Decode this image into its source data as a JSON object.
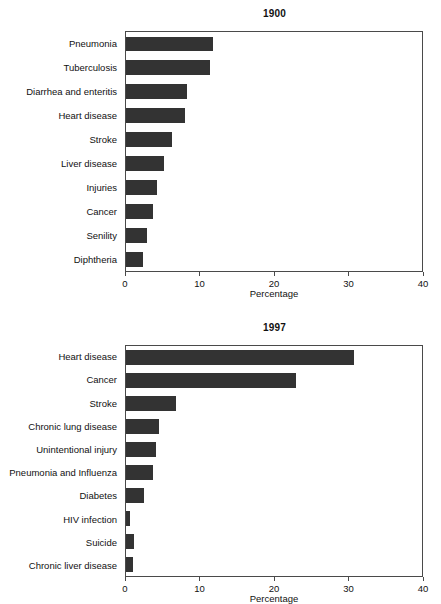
{
  "chart_data": [
    {
      "type": "bar",
      "orientation": "horizontal",
      "title": "1900",
      "xlabel": "Percentage",
      "ylabel": "",
      "xlim": [
        0,
        40
      ],
      "xticks": [
        0,
        10,
        20,
        30,
        40
      ],
      "xticklabels": [
        "0",
        "10",
        "20",
        "30",
        "40"
      ],
      "grid": false,
      "legend": false,
      "bar_color": "#333333",
      "frame_color": "#4a4a4a",
      "categories": [
        "Pneumonia",
        "Tuberculosis",
        "Diarrhea and enteritis",
        "Heart disease",
        "Stroke",
        "Liver disease",
        "Injuries",
        "Cancer",
        "Senility",
        "Diphtheria"
      ],
      "values": [
        11.8,
        11.3,
        8.3,
        8.0,
        6.2,
        5.2,
        4.2,
        3.7,
        2.9,
        2.3
      ]
    },
    {
      "type": "bar",
      "orientation": "horizontal",
      "title": "1997",
      "xlabel": "Percentage",
      "ylabel": "",
      "xlim": [
        0,
        40
      ],
      "xticks": [
        0,
        10,
        20,
        30,
        40
      ],
      "xticklabels": [
        "0",
        "10",
        "20",
        "30",
        "40"
      ],
      "grid": false,
      "legend": false,
      "bar_color": "#333333",
      "frame_color": "#4a4a4a",
      "categories": [
        "Heart disease",
        "Cancer",
        "Stroke",
        "Chronic lung disease",
        "Unintentional injury",
        "Pneumonia and Influenza",
        "Diabetes",
        "HIV infection",
        "Suicide",
        "Chronic liver disease"
      ],
      "values": [
        30.8,
        23.0,
        6.8,
        4.5,
        4.0,
        3.6,
        2.4,
        0.6,
        1.1,
        0.9
      ]
    }
  ]
}
